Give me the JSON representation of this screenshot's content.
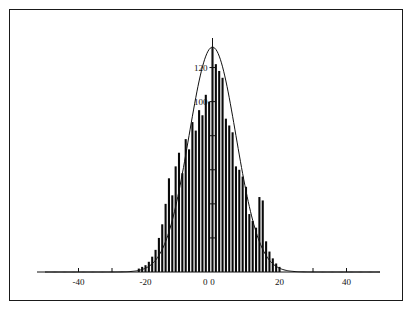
{
  "figure": {
    "background_color": "#ffffff",
    "border_color": "#1a1a1a",
    "ink_color": "#0a0a0a"
  },
  "chart_data": {
    "type": "bar",
    "title": "",
    "subtitle": "",
    "xlabel": "",
    "ylabel": "",
    "grid": false,
    "legend": null,
    "annotations": [],
    "xlim": [
      -50,
      50
    ],
    "ylim": [
      0,
      135
    ],
    "x_ticks": [
      -40,
      -30,
      -20,
      -10,
      0,
      10,
      20,
      30,
      40
    ],
    "x_tick_labels": [
      "-40",
      "",
      "-20",
      "",
      "0",
      "",
      "20",
      "",
      "40"
    ],
    "y_ticks": [
      0,
      20,
      40,
      60,
      80,
      100,
      120
    ],
    "y_tick_labels": [
      "0",
      "",
      "",
      "",
      "",
      "100",
      "120"
    ],
    "bin_width": 1,
    "categories": [
      -22,
      -21,
      -20,
      -19,
      -18,
      -17,
      -16,
      -15,
      -14,
      -13,
      -12,
      -11,
      -10,
      -9,
      -8,
      -7,
      -6,
      -5,
      -4,
      -3,
      -2,
      -1,
      0,
      1,
      2,
      3,
      4,
      5,
      6,
      7,
      8,
      9,
      10,
      11,
      12,
      13,
      14,
      15,
      16,
      17,
      18,
      19,
      20
    ],
    "values": [
      2,
      3,
      4,
      6,
      9,
      13,
      20,
      28,
      40,
      55,
      45,
      62,
      70,
      58,
      78,
      72,
      88,
      83,
      95,
      92,
      104,
      100,
      132,
      122,
      118,
      114,
      90,
      86,
      82,
      62,
      60,
      56,
      50,
      34,
      30,
      26,
      44,
      42,
      18,
      12,
      8,
      5,
      3
    ],
    "overlay_curve": {
      "type": "line",
      "description": "smooth normal density overlay",
      "peak_x": 0,
      "peak_y": 132,
      "mean": 0,
      "std": 7.0
    }
  }
}
